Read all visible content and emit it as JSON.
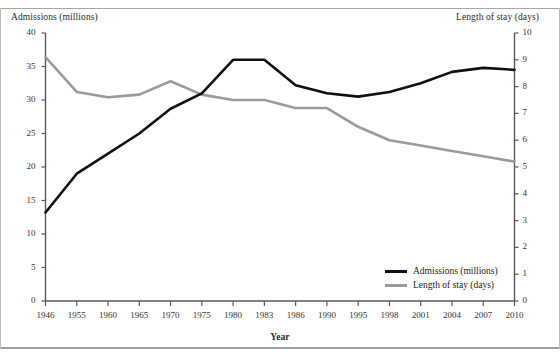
{
  "chart_data": {
    "type": "line",
    "title": "",
    "xlabel": "Year",
    "ylabel": "Admissions (millions)",
    "y2label": "Length of stay (days)",
    "categories": [
      "1946",
      "1955",
      "1960",
      "1965",
      "1970",
      "1975",
      "1980",
      "1983",
      "1986",
      "1990",
      "1995",
      "1998",
      "2001",
      "2004",
      "2007",
      "2010"
    ],
    "ylim": [
      0,
      40
    ],
    "y2lim": [
      0,
      10
    ],
    "yticks": [
      0,
      5,
      10,
      15,
      20,
      25,
      30,
      35,
      40
    ],
    "y2ticks": [
      0,
      1,
      2,
      3,
      4,
      5,
      6,
      7,
      8,
      9,
      10
    ],
    "grid": false,
    "legend_position": "bottom-right",
    "series": [
      {
        "name": "Admissions (millions)",
        "axis": "left",
        "color": "#101010",
        "values": [
          13.2,
          19.0,
          22.0,
          25.0,
          28.7,
          31.0,
          36.0,
          36.0,
          32.2,
          31.0,
          30.5,
          31.2,
          32.5,
          34.2,
          34.8,
          34.5
        ]
      },
      {
        "name": "Length of stay (days)",
        "axis": "right",
        "color": "#9b9b9b",
        "values": [
          9.1,
          7.8,
          7.6,
          7.7,
          8.2,
          7.7,
          7.5,
          7.5,
          7.2,
          7.2,
          6.5,
          6.0,
          5.8,
          5.6,
          5.4,
          5.2
        ]
      }
    ]
  },
  "axes": {
    "left_title": "Admissions (millions)",
    "right_title": "Length of stay (days)",
    "x_title": "Year"
  },
  "legend": {
    "items": [
      {
        "label": "Admissions (millions)",
        "color": "#101010"
      },
      {
        "label": "Length of stay (days)",
        "color": "#9b9b9b"
      }
    ]
  }
}
